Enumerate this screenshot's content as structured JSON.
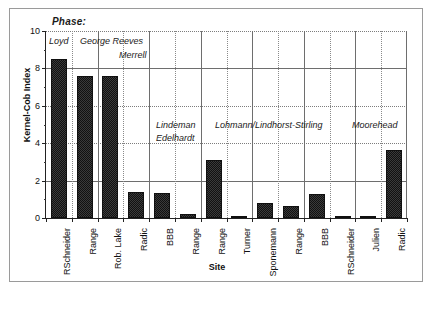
{
  "figure": {
    "phase_caption": "Phase:",
    "x_axis_title": "Site",
    "y_axis_title": "Kernel-Cob Index"
  },
  "chart_data": {
    "type": "bar",
    "title": "",
    "xlabel": "Site",
    "ylabel": "Kernel-Cob Index",
    "ylim": [
      0,
      10
    ],
    "yticks": [
      0,
      2,
      4,
      6,
      8,
      10
    ],
    "grid": true,
    "legend": "none",
    "categories": [
      "RSchneider",
      "Range",
      "Rob. Lake",
      "Radic",
      "BBB",
      "Range",
      "Range",
      "Turner",
      "Sponemann",
      "Range",
      "BBB",
      "RSchneider",
      "Julien",
      "Radic"
    ],
    "values": [
      8.5,
      7.6,
      7.6,
      1.4,
      1.35,
      0.2,
      3.1,
      0.13,
      0.8,
      0.65,
      1.3,
      0.06,
      0.1,
      3.65
    ],
    "group_label_header": "Phase:",
    "groups": [
      {
        "label": "Loyd",
        "categories": [
          "RSchneider"
        ]
      },
      {
        "label": "George Reeves",
        "categories": [
          "Range",
          "Rob. Lake"
        ]
      },
      {
        "label": "Merrell",
        "categories": [
          "Radic"
        ]
      },
      {
        "label": "Lindeman Edelhardt",
        "categories": [
          "BBB",
          "Range"
        ]
      },
      {
        "label": "Lohmann/Lindhorst-Stirling",
        "categories": [
          "Range",
          "Turner",
          "Sponemann",
          "Range",
          "BBB"
        ]
      },
      {
        "label": "Moorehead",
        "categories": [
          "RSchneider",
          "Julien",
          "Radic"
        ]
      }
    ],
    "phase_annotations": [
      "Loyd",
      "George Reeves",
      "Merrell",
      "Lindeman",
      "Edelhardt",
      "Lohmann/Lindhorst-Stirling",
      "Moorehead"
    ]
  }
}
